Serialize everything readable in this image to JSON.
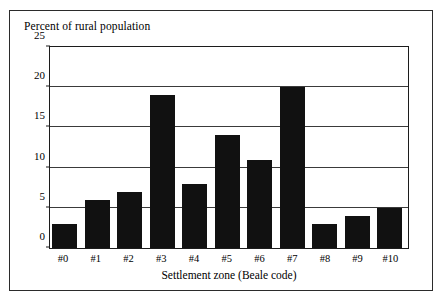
{
  "figure": {
    "border_color": "#2b2b2b",
    "background": "#ffffff"
  },
  "chart_data": {
    "type": "bar",
    "title": "Percent of rural population",
    "xlabel": "Settlement zone (Beale code)",
    "ylabel": "",
    "categories": [
      "#0",
      "#1",
      "#2",
      "#3",
      "#4",
      "#5",
      "#6",
      "#7",
      "#8",
      "#9",
      "#10"
    ],
    "values": [
      3,
      6,
      7,
      19,
      8,
      14,
      11,
      20,
      3,
      4,
      5
    ],
    "ylim": [
      0,
      25
    ],
    "ytick_labels": [
      "0",
      "5",
      "10",
      "15",
      "20",
      "25"
    ],
    "ytick_values": [
      0,
      5,
      10,
      15,
      20,
      25
    ],
    "gridline_values": [
      5,
      10,
      15,
      20
    ],
    "grid": true,
    "legend": false,
    "bar_color": "#111111",
    "axis_color": "#1c1c1c",
    "grid_color": "#3a3a3a"
  }
}
